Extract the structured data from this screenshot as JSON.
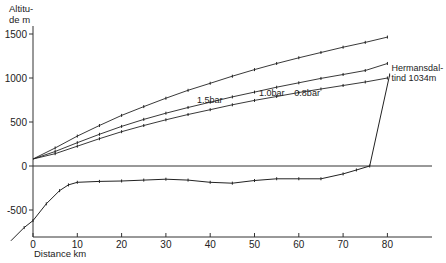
{
  "chart_data": {
    "type": "line",
    "title": "",
    "ylabel_lines": [
      "Altitu-",
      "de m"
    ],
    "xlabel": "Distance  km",
    "xlim": [
      -5,
      92
    ],
    "ylim": [
      -870,
      1560
    ],
    "xticks": [
      0,
      10,
      20,
      30,
      40,
      50,
      60,
      70,
      80
    ],
    "xtick_labels": [
      "0",
      "10",
      "20",
      "30",
      "40",
      "50",
      "60",
      "70",
      "80"
    ],
    "yticks": [
      1500,
      1000,
      500,
      0,
      -500
    ],
    "ytick_labels": [
      "1500",
      "1000",
      "500",
      "0",
      "-500"
    ],
    "grid": false,
    "zero_line": true,
    "series": [
      {
        "name": "1.5 bar",
        "label": "1.5bar",
        "label_at": [
          37,
          720
        ],
        "x": [
          0,
          5,
          10,
          15,
          20,
          25,
          30,
          35,
          40,
          45,
          50,
          55,
          60,
          65,
          70,
          75,
          80
        ],
        "y": [
          80,
          205,
          340,
          460,
          575,
          675,
          770,
          860,
          940,
          1020,
          1095,
          1165,
          1230,
          1290,
          1350,
          1405,
          1465
        ]
      },
      {
        "name": "1.0 bar",
        "label": "1.0bar",
        "label_at": [
          51,
          790
        ],
        "x": [
          0,
          5,
          10,
          15,
          20,
          25,
          30,
          35,
          40,
          45,
          50,
          55,
          60,
          65,
          70,
          75,
          80
        ],
        "y": [
          80,
          165,
          265,
          360,
          450,
          530,
          600,
          665,
          725,
          785,
          840,
          895,
          945,
          995,
          1040,
          1085,
          1165
        ]
      },
      {
        "name": "0.8 bar",
        "label": "0.8bar",
        "label_at": [
          59,
          790
        ],
        "x": [
          0,
          5,
          10,
          15,
          20,
          25,
          30,
          35,
          40,
          45,
          50,
          55,
          60,
          65,
          70,
          75,
          80
        ],
        "y": [
          80,
          140,
          225,
          310,
          390,
          460,
          525,
          585,
          640,
          695,
          745,
          790,
          835,
          875,
          915,
          955,
          1000
        ]
      },
      {
        "name": "Terrain profile",
        "x": [
          -5,
          -2,
          0,
          3,
          6,
          8,
          10,
          15,
          20,
          25,
          30,
          35,
          40,
          45,
          50,
          55,
          60,
          65,
          70,
          73,
          76,
          80.5
        ],
        "y": [
          -850,
          -700,
          -620,
          -430,
          -280,
          -215,
          -185,
          -175,
          -170,
          -160,
          -150,
          -160,
          -185,
          -195,
          -165,
          -145,
          -145,
          -145,
          -90,
          -45,
          0,
          1034
        ]
      }
    ],
    "annotations": [
      {
        "text_lines": [
          "Hermansdal-",
          "tind  1034m"
        ],
        "x": 80.5,
        "y": 1034
      }
    ]
  }
}
